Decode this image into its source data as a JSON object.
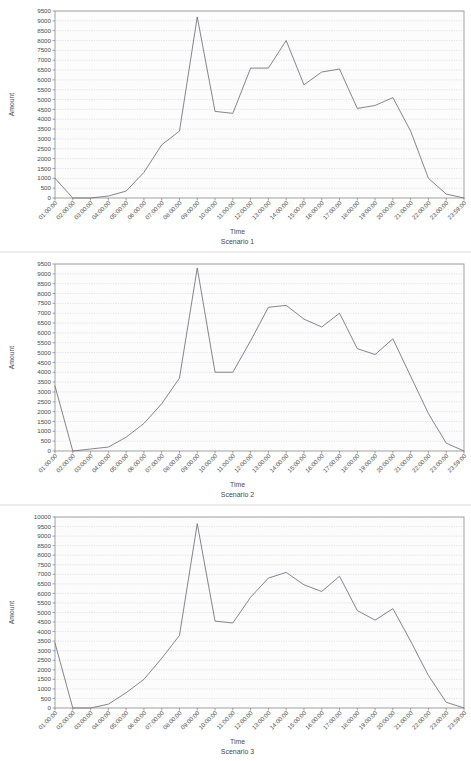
{
  "page": {
    "background": "#ffffff",
    "line_color": "#6f6f76",
    "grid_color": "#b9b9c4",
    "frame_color": "#8a8a8a"
  },
  "common": {
    "xlabel": "Time",
    "ylabel": "Amount",
    "x_categories": [
      "01:00:00",
      "02:00:00",
      "03:00:00",
      "04:00:00",
      "05:00:00",
      "06:00:00",
      "07:00:00",
      "08:00:00",
      "09:00:00",
      "10:00:00",
      "11:00:00",
      "12:00:00",
      "13:00:00",
      "14:00:00",
      "15:00:00",
      "16:00:00",
      "17:00:00",
      "18:00:00",
      "19:00:00",
      "20:00:00",
      "21:00:00",
      "22:00:00",
      "23:00:00",
      "23:59:00"
    ]
  },
  "chart_data": [
    {
      "type": "line",
      "title": "Scenario 1",
      "xlabel": "Time",
      "ylabel": "Amount",
      "grid": true,
      "legend": "none",
      "ylim": [
        0,
        9500
      ],
      "ytick_step": 500,
      "yticks": [
        0,
        500,
        1000,
        1500,
        2000,
        2500,
        3000,
        3500,
        4000,
        4500,
        5000,
        5500,
        6000,
        6500,
        7000,
        7500,
        8000,
        8500,
        9000,
        9500
      ],
      "x": [
        "01:00:00",
        "02:00:00",
        "03:00:00",
        "04:00:00",
        "05:00:00",
        "06:00:00",
        "07:00:00",
        "08:00:00",
        "09:00:00",
        "10:00:00",
        "11:00:00",
        "12:00:00",
        "13:00:00",
        "14:00:00",
        "15:00:00",
        "16:00:00",
        "17:00:00",
        "18:00:00",
        "19:00:00",
        "20:00:00",
        "21:00:00",
        "22:00:00",
        "23:00:00",
        "23:59:00"
      ],
      "values": [
        1000,
        0,
        0,
        100,
        350,
        1300,
        2700,
        3400,
        9200,
        4400,
        4300,
        6600,
        6600,
        8000,
        5750,
        6400,
        6550,
        4550,
        4700,
        5100,
        3400,
        1000,
        200,
        0
      ]
    },
    {
      "type": "line",
      "title": "Scenario 2",
      "xlabel": "Time",
      "ylabel": "Amount",
      "grid": true,
      "legend": "none",
      "ylim": [
        0,
        9500
      ],
      "ytick_step": 500,
      "yticks": [
        0,
        500,
        1000,
        1500,
        2000,
        2500,
        3000,
        3500,
        4000,
        4500,
        5000,
        5500,
        6000,
        6500,
        7000,
        7500,
        8000,
        8500,
        9000,
        9500
      ],
      "x": [
        "01:00:00",
        "02:00:00",
        "03:00:00",
        "04:00:00",
        "05:00:00",
        "06:00:00",
        "07:00:00",
        "08:00:00",
        "09:00:00",
        "10:00:00",
        "11:00:00",
        "12:00:00",
        "13:00:00",
        "14:00:00",
        "15:00:00",
        "16:00:00",
        "17:00:00",
        "18:00:00",
        "19:00:00",
        "20:00:00",
        "21:00:00",
        "22:00:00",
        "23:00:00",
        "23:59:00"
      ],
      "values": [
        3300,
        0,
        100,
        200,
        700,
        1400,
        2400,
        3700,
        9300,
        4000,
        4000,
        5600,
        7300,
        7400,
        6700,
        6300,
        7000,
        5200,
        4900,
        5700,
        3800,
        1900,
        400,
        0
      ]
    },
    {
      "type": "line",
      "title": "Scenario 3",
      "xlabel": "Time",
      "ylabel": "Amount",
      "grid": true,
      "legend": "none",
      "ylim": [
        0,
        10000
      ],
      "ytick_step": 500,
      "yticks": [
        0,
        500,
        1000,
        1500,
        2000,
        2500,
        3000,
        3500,
        4000,
        4500,
        5000,
        5500,
        6000,
        6500,
        7000,
        7500,
        8000,
        8500,
        9000,
        9500,
        10000
      ],
      "x": [
        "01:00:00",
        "02:00:00",
        "03:00:00",
        "04:00:00",
        "05:00:00",
        "06:00:00",
        "07:00:00",
        "08:00:00",
        "09:00:00",
        "10:00:00",
        "11:00:00",
        "12:00:00",
        "13:00:00",
        "14:00:00",
        "15:00:00",
        "16:00:00",
        "17:00:00",
        "18:00:00",
        "19:00:00",
        "20:00:00",
        "21:00:00",
        "22:00:00",
        "23:00:00",
        "23:59:00"
      ],
      "values": [
        3400,
        0,
        0,
        200,
        800,
        1500,
        2600,
        3800,
        9650,
        4550,
        4450,
        5800,
        6800,
        7100,
        6450,
        6100,
        6900,
        5100,
        4600,
        5200,
        3500,
        1700,
        300,
        0
      ]
    }
  ]
}
